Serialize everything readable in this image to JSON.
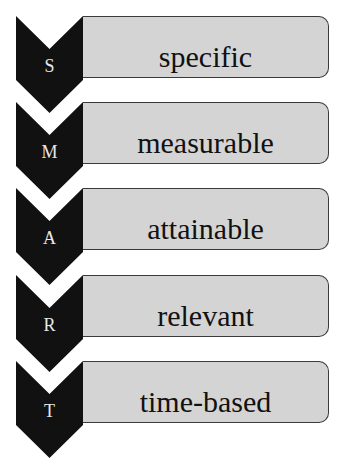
{
  "items": [
    {
      "letter": "S",
      "label": "specific"
    },
    {
      "letter": "M",
      "label": "measurable"
    },
    {
      "letter": "A",
      "label": "attainable"
    },
    {
      "letter": "R",
      "label": "relevant"
    },
    {
      "letter": "T",
      "label": "time-based"
    }
  ],
  "colors": {
    "chevron": "#111111",
    "box": "#d4d4d4",
    "border": "#3a3a3a",
    "letter": "#e8e8e8"
  }
}
